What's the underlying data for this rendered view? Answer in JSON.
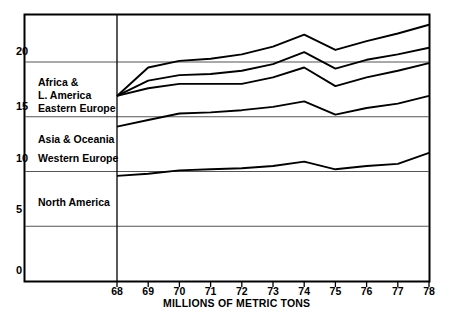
{
  "chart_data": {
    "type": "line",
    "title": "",
    "xlabel": "MILLIONS OF METRIC TONS",
    "ylabel": "",
    "xlim": [
      68,
      78
    ],
    "ylim": [
      0,
      23.8
    ],
    "grid": true,
    "legend_position": "inline-left",
    "x": [
      68,
      69,
      70,
      71,
      72,
      73,
      74,
      75,
      76,
      77,
      78
    ],
    "xtick_labels": [
      "68",
      "69",
      "70",
      "71",
      "72",
      "73",
      "74",
      "75",
      "76",
      "77",
      "78"
    ],
    "ytick_labels": [
      "0",
      "5",
      "10",
      "15",
      "20"
    ],
    "yticks": [
      0,
      5,
      10,
      15,
      20
    ],
    "note": "Cumulative stacked bands; plotted curves are running totals from bottom.",
    "series": [
      {
        "name": "North America",
        "label": "North America",
        "label_x": 72.4,
        "label_y": 4.0,
        "values": [
          9.6,
          9.8,
          10.1,
          10.2,
          10.3,
          10.5,
          10.9,
          10.2,
          10.5,
          10.7,
          11.7
        ]
      },
      {
        "name": "Western Europe",
        "label": "Western Europe",
        "label_x": 72.4,
        "label_y": 9.6,
        "values": [
          14.1,
          14.7,
          15.3,
          15.4,
          15.6,
          15.9,
          16.4,
          15.2,
          15.8,
          16.2,
          16.9
        ]
      },
      {
        "name": "Asia & Oceania",
        "label": "Asia & Oceania",
        "label_x": 72.4,
        "label_y": 12.3,
        "values": [
          16.9,
          17.6,
          18.0,
          18.0,
          18.0,
          18.6,
          19.5,
          17.8,
          18.6,
          19.2,
          19.9
        ]
      },
      {
        "name": "Eastern Europe",
        "label": "Eastern Europe",
        "label_x": 72.4,
        "label_y": 14.6,
        "values": [
          16.9,
          18.3,
          18.8,
          18.9,
          19.2,
          19.8,
          20.9,
          19.4,
          20.2,
          20.7,
          21.3
        ]
      },
      {
        "name": "Africa & L. America",
        "label": "Africa &",
        "label_line2": "L. America",
        "label_x": 72.4,
        "label_y": 16.7,
        "values": [
          16.9,
          19.5,
          20.1,
          20.3,
          20.7,
          21.4,
          22.5,
          21.1,
          21.9,
          22.6,
          23.4
        ]
      }
    ]
  },
  "axis": {
    "x_axis_title": "MILLIONS OF METRIC TONS"
  },
  "labels": {
    "africa": "Africa &",
    "latin_america": "L. America",
    "eastern_europe": "Eastern Europe",
    "asia_oceania": "Asia & Oceania",
    "western_europe": "Western Europe",
    "north_america": "North America",
    "y0": "0",
    "y5": "5",
    "y10": "10",
    "y15": "15",
    "y20": "20"
  },
  "colors": {
    "line": "#000000",
    "gridline": "#555555",
    "background": "#ffffff",
    "text": "#000000"
  }
}
